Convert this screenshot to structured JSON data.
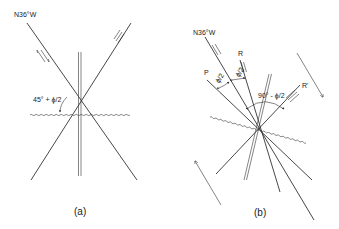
{
  "panel_a": {
    "caption": "(a)",
    "strike_label": "N36°W",
    "angle_label": "45° + ϕ/2"
  },
  "panel_b": {
    "caption": "(b)",
    "strike_label": "N36°W",
    "label_R": "R",
    "label_P": "P",
    "label_R_prime": "R'",
    "angle_label_1": "ϕ/2",
    "angle_label_2": "ϕ/2",
    "angle_label_3": "90° - ϕ/2"
  },
  "colors": {
    "line": "#333333",
    "background": "#ffffff"
  }
}
